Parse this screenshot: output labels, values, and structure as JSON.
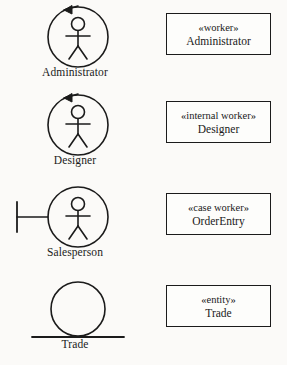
{
  "diagram": {
    "background_color": "#fbfaf8",
    "line_color": "#1b1b1b",
    "rows": [
      {
        "icon_name": "worker-actor-icon",
        "icon_kind": "circle-arrow-actor",
        "icon_label": "Administrator",
        "stereotype": "«worker»",
        "classname": "Administrator"
      },
      {
        "icon_name": "internal-worker-actor-icon",
        "icon_kind": "circle-arrow-actor",
        "icon_label": "Designer",
        "stereotype": "«internal worker»",
        "classname": "Designer"
      },
      {
        "icon_name": "case-worker-actor-icon",
        "icon_kind": "boundary-actor",
        "icon_label": "Salesperson",
        "stereotype": "«case worker»",
        "classname": "OrderEntry"
      },
      {
        "icon_name": "entity-icon",
        "icon_kind": "entity-circle-on-line",
        "icon_label": "Trade",
        "stereotype": "«entity»",
        "classname": "Trade"
      }
    ]
  }
}
